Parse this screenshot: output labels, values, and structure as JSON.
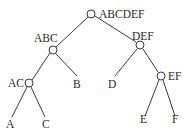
{
  "diagram": {
    "type": "binary-tree",
    "nodes": [
      {
        "id": "ABCDEF",
        "label": "ABCDEF",
        "x": 91,
        "y": 14,
        "internal": true
      },
      {
        "id": "ABC",
        "label": "ABC",
        "x": 53,
        "y": 50,
        "internal": true
      },
      {
        "id": "DEF",
        "label": "DEF",
        "x": 140,
        "y": 45,
        "internal": true
      },
      {
        "id": "AC",
        "label": "AC",
        "x": 29,
        "y": 83,
        "internal": true
      },
      {
        "id": "B",
        "label": "B",
        "x": 79,
        "y": 83,
        "internal": false
      },
      {
        "id": "D",
        "label": "D",
        "x": 112,
        "y": 83,
        "internal": false
      },
      {
        "id": "EF",
        "label": "EF",
        "x": 161,
        "y": 76,
        "internal": true
      },
      {
        "id": "A",
        "label": "A",
        "x": 11,
        "y": 125,
        "internal": false
      },
      {
        "id": "C",
        "label": "C",
        "x": 46,
        "y": 125,
        "internal": false
      },
      {
        "id": "E",
        "label": "E",
        "x": 143,
        "y": 125,
        "internal": false
      },
      {
        "id": "F",
        "label": "F",
        "x": 176,
        "y": 125,
        "internal": false
      }
    ],
    "edges": [
      [
        "ABCDEF",
        "ABC"
      ],
      [
        "ABCDEF",
        "DEF"
      ],
      [
        "ABC",
        "AC"
      ],
      [
        "ABC",
        "B"
      ],
      [
        "AC",
        "A"
      ],
      [
        "AC",
        "C"
      ],
      [
        "DEF",
        "D"
      ],
      [
        "DEF",
        "EF"
      ],
      [
        "EF",
        "E"
      ],
      [
        "EF",
        "F"
      ]
    ],
    "colors": {
      "line": "#3a3a3a",
      "text": "#2a2a2a",
      "background": "#ffffff"
    }
  }
}
